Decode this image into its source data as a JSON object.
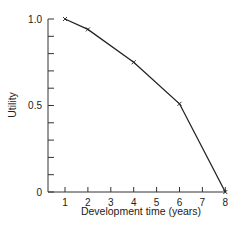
{
  "chart_data": {
    "type": "line",
    "title": "",
    "xlabel": "Development time (years)",
    "ylabel": "Utility",
    "x": [
      1,
      2,
      4,
      6,
      8
    ],
    "series": [
      {
        "name": "Utility",
        "values": [
          1.0,
          0.94,
          0.75,
          0.51,
          0.0
        ],
        "marker": "x",
        "color": "#222222"
      }
    ],
    "xlim": [
      0,
      8
    ],
    "ylim": [
      0,
      1.0
    ],
    "x_ticks": [
      "1",
      "2",
      "3",
      "4",
      "5",
      "6",
      "7",
      "8"
    ],
    "y_tick_labels": [
      "0",
      "0.5",
      "1.0"
    ],
    "y_minor_ticks": 10,
    "grid": false,
    "legend": null
  },
  "colors": {
    "axis": "#333333",
    "line": "#222222",
    "background": "#ffffff"
  }
}
